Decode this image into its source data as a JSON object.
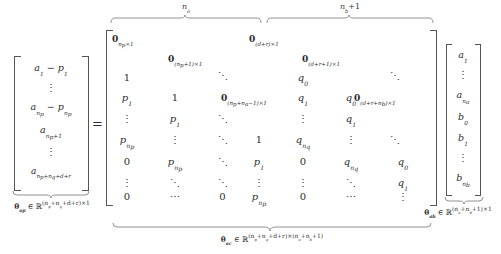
{
  "figure": {
    "type": "matrix-equation"
  },
  "equals": "=",
  "left_vector": {
    "name": "theta-ap",
    "rows": [
      "a₁ − p₁",
      "⋮",
      "a",
      "a",
      "⋮",
      "a"
    ],
    "r1": "a",
    "r1_sub": "1",
    "r1_minus": " − ",
    "r1_p": "p",
    "r1_psub": "1",
    "r3_a": "a",
    "r3_sub": "n",
    "r3_sub2": "p",
    "r3_p": "p",
    "r3_psub": "n",
    "r3_psub2": "p",
    "r4_a": "a",
    "r4_sub": "n",
    "r4_sub2": "p",
    "r4_plus": "+1",
    "r6_a": "a",
    "r6_sub": "n",
    "r6_sub2": "p",
    "r6_rest": "+n",
    "r6_sub3": "q",
    "r6_rest2": "+d+r",
    "vdots": "⋮",
    "label_theta": "θ",
    "label_sub": "ap",
    "label_in": " ∈ ℝ",
    "label_exp": "(n",
    "label_exp_sub": "p",
    "label_exp2": "+n",
    "label_exp_sub2": "q",
    "label_exp3": "+d+r)×1"
  },
  "matrix": {
    "name": "theta-ac",
    "top_brace_left_label": {
      "sym": "n",
      "sub": "a"
    },
    "top_brace_right_label": {
      "sym": "n",
      "sub": "b",
      "suffix": "+1"
    },
    "zero_blocks": [
      {
        "id": "z-col1-top",
        "bold": "0",
        "sub": "n",
        "sub2": "p",
        "rest": "×1"
      },
      {
        "id": "z-col2-top",
        "bold": "0",
        "sub": "(n",
        "sub2": "p",
        "rest": "+1)×1"
      },
      {
        "id": "z-mid-right",
        "bold": "0",
        "sub": "(n",
        "sub2": "p",
        "rest": "+n",
        "sub3": "a",
        "rest2": "−1)×1"
      },
      {
        "id": "z-col4-top",
        "bold": "0",
        "sub": "(d+r)",
        "rest": "×1"
      },
      {
        "id": "z-col5-top",
        "bold": "0",
        "sub": "(d+r+1)",
        "rest": "×1"
      },
      {
        "id": "z-col6-right",
        "bold": "0",
        "sub": "(d+r+n",
        "sub2": "b",
        "rest": ")×1"
      }
    ],
    "entries_p": {
      "one": "1",
      "p": "p",
      "p1_sub": "1",
      "pn_sub": "n",
      "pn_sub2": "p",
      "zero": "0",
      "vdots": "⋮",
      "ddots": "⋱",
      "cdots": "⋯"
    },
    "entries_q": {
      "q": "q",
      "q0_sub": "0",
      "q1_sub": "1",
      "qn_sub": "n",
      "qn_sub2": "q",
      "zero": "0",
      "vdots": "⋮",
      "ddots": "⋱"
    },
    "bottom_label": {
      "theta": "θ",
      "sub": "ac",
      "in": " ∈ ℝ",
      "exp_a": "(n",
      "exp_a_sub": "p",
      "exp_b": "+n",
      "exp_b_sub": "q",
      "exp_c": "+d+r)×(n",
      "exp_c_sub": "a",
      "exp_d": "+n",
      "exp_d_sub": "b",
      "exp_e": "+1)"
    }
  },
  "right_vector": {
    "name": "theta-ab",
    "rows": [
      "a₁",
      "⋮",
      "a",
      "b₀",
      "b₁",
      "⋮",
      "b"
    ],
    "a": "a",
    "a1_sub": "1",
    "an_sub": "n",
    "an_sub2": "a",
    "b": "b",
    "b0_sub": "0",
    "b1_sub": "1",
    "bn_sub": "n",
    "bn_sub2": "b",
    "vdots": "⋮",
    "label_theta": "θ",
    "label_sub": "ab",
    "label_in": " ∈ ℝ",
    "label_exp": "(n",
    "label_exp_sub": "a",
    "label_exp2": "+n",
    "label_exp_sub2": "b",
    "label_exp3": "+1)×1"
  }
}
